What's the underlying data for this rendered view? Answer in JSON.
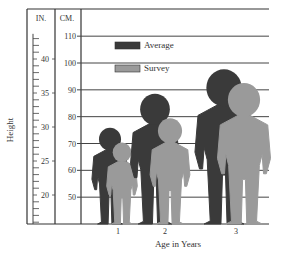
{
  "chart_data": {
    "type": "bar",
    "title": "",
    "xlabel": "Age in Years",
    "ylabel": "Height",
    "categories": [
      "1",
      "2",
      "3"
    ],
    "series": [
      {
        "name": "Average",
        "color": "#3a3a3a",
        "values": [
          75.5,
          88,
          97
        ]
      },
      {
        "name": "Survey",
        "color": "#9a9a9a",
        "values": [
          70,
          79,
          92
        ]
      }
    ],
    "cm_axis": {
      "header": "CM.",
      "ticks": [
        50,
        60,
        70,
        80,
        90,
        100,
        110
      ],
      "range": [
        40,
        120
      ]
    },
    "in_axis": {
      "header": "IN.",
      "labeled_ticks": [
        20,
        25,
        30,
        35,
        40
      ],
      "range": [
        15.75,
        43.7
      ]
    },
    "legend": {
      "placement": "top-left",
      "entries": [
        "Average",
        "Survey"
      ]
    },
    "grid": true,
    "marker": "child-silhouette"
  }
}
